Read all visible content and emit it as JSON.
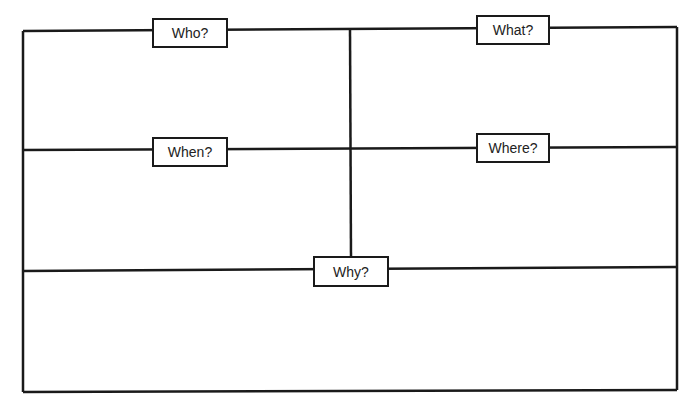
{
  "diagram": {
    "type": "5W graphic organizer",
    "line_color": "#1a1a1a",
    "background": "#ffffff",
    "boxes": [
      {
        "id": "who",
        "label": "Who?",
        "x": 152,
        "y": 18,
        "w": 76,
        "h": 30
      },
      {
        "id": "what",
        "label": "What?",
        "x": 476,
        "y": 15,
        "w": 74,
        "h": 30
      },
      {
        "id": "when",
        "label": "When?",
        "x": 152,
        "y": 137,
        "w": 76,
        "h": 30
      },
      {
        "id": "where",
        "label": "Where?",
        "x": 476,
        "y": 133,
        "w": 74,
        "h": 30
      },
      {
        "id": "why",
        "label": "Why?",
        "x": 313,
        "y": 256,
        "w": 76,
        "h": 31
      }
    ]
  }
}
